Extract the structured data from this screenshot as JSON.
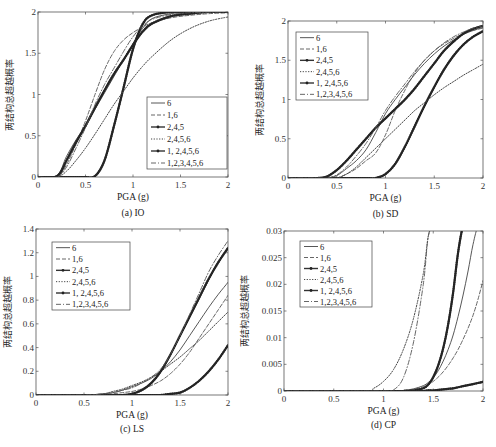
{
  "figure": {
    "ylabel_text": "两结构总超越概率",
    "xlabel_text": "PGA (g)"
  },
  "legend_labels": [
    "6",
    "1,6",
    "2,4,5",
    "2,4,5,6",
    "1, 2,4,5,6",
    "1,2,3,4,5,6"
  ],
  "series_styles": [
    {
      "name": "6",
      "dash": "",
      "width": 0.9,
      "color": "#444444",
      "marker": false
    },
    {
      "name": "1,6",
      "dash": "4,2",
      "width": 0.9,
      "color": "#555555",
      "marker": false
    },
    {
      "name": "2,4,5",
      "dash": "",
      "width": 2.2,
      "color": "#333333",
      "marker": true
    },
    {
      "name": "2,4,5,6",
      "dash": "1.2,1.5",
      "width": 1.0,
      "color": "#444444",
      "marker": false
    },
    {
      "name": "1, 2,4,5,6",
      "dash": "",
      "width": 2.2,
      "color": "#333333",
      "marker": true
    },
    {
      "name": "1,2,3,4,5,6",
      "dash": "5,2,1,2",
      "width": 0.9,
      "color": "#555555",
      "marker": false
    }
  ],
  "chart_data": [
    {
      "type": "line",
      "id": "a",
      "caption": "(a) IO",
      "title": "",
      "xlabel": "PGA (g)",
      "ylabel": "两结构总超越概率",
      "xlim": [
        0,
        2
      ],
      "ylim": [
        0,
        2
      ],
      "xticks": [
        "0",
        "0.5",
        "1",
        "1.5",
        "2"
      ],
      "yticks": [
        "0",
        "0.5",
        "1",
        "1.5",
        "2"
      ],
      "legend_position": "lower right",
      "box": {
        "x0": 38,
        "y0": 12,
        "x1": 228,
        "y1": 177
      },
      "legend_box": {
        "x": 147,
        "y": 97,
        "w": 80,
        "h": 72
      },
      "x": [
        0,
        0.2,
        0.3,
        0.4,
        0.5,
        0.6,
        0.7,
        0.8,
        0.9,
        1.0,
        1.1,
        1.2,
        1.4,
        1.6,
        1.8,
        2.0
      ],
      "series": [
        {
          "name": "6",
          "values": [
            0,
            0.02,
            0.25,
            0.45,
            0.62,
            0.82,
            1.02,
            1.22,
            1.42,
            1.62,
            1.8,
            1.92,
            1.98,
            2.0,
            2.0,
            2.0
          ]
        },
        {
          "name": "1,6",
          "values": [
            0,
            0.0,
            0.15,
            0.4,
            0.68,
            1.0,
            1.3,
            1.52,
            1.66,
            1.75,
            1.82,
            1.87,
            1.93,
            1.96,
            1.98,
            1.99
          ]
        },
        {
          "name": "2,4,5",
          "values": [
            0,
            0,
            0,
            0,
            0,
            0.01,
            0.2,
            0.62,
            1.08,
            1.55,
            1.85,
            1.96,
            2.0,
            2.0,
            2.0,
            2.0
          ]
        },
        {
          "name": "2,4,5,6",
          "values": [
            0,
            0.0,
            0.07,
            0.2,
            0.35,
            0.52,
            0.7,
            0.88,
            1.04,
            1.2,
            1.34,
            1.46,
            1.66,
            1.8,
            1.89,
            1.94
          ]
        },
        {
          "name": "1, 2,4,5,6",
          "values": [
            0,
            0.01,
            0.2,
            0.42,
            0.62,
            0.84,
            1.05,
            1.25,
            1.42,
            1.6,
            1.76,
            1.86,
            1.95,
            1.98,
            2.0,
            2.0
          ]
        },
        {
          "name": "1,2,3,4,5,6",
          "values": [
            0,
            0.0,
            0.12,
            0.35,
            0.6,
            0.88,
            1.12,
            1.32,
            1.52,
            1.7,
            1.83,
            1.91,
            1.97,
            1.99,
            2.0,
            2.0
          ]
        }
      ]
    },
    {
      "type": "line",
      "id": "b",
      "caption": "(b) SD",
      "title": "",
      "xlabel": "PGA (g)",
      "ylabel": "两结构总超越概率",
      "xlim": [
        0,
        2
      ],
      "ylim": [
        0,
        2
      ],
      "xticks": [
        "0",
        "0.5",
        "1",
        "1.5",
        "2"
      ],
      "yticks": [
        "0",
        "0.5",
        "1",
        "1.5",
        "2"
      ],
      "legend_position": "upper left",
      "box": {
        "x0": 288,
        "y0": 21,
        "x1": 483,
        "y1": 178
      },
      "legend_box": {
        "x": 296,
        "y": 32,
        "w": 72,
        "h": 68
      },
      "x": [
        0,
        0.3,
        0.4,
        0.5,
        0.6,
        0.7,
        0.8,
        0.9,
        1.0,
        1.1,
        1.2,
        1.3,
        1.4,
        1.5,
        1.6,
        1.7,
        1.8,
        1.9,
        2.0
      ],
      "series": [
        {
          "name": "6",
          "values": [
            0,
            0,
            0.0,
            0.03,
            0.12,
            0.22,
            0.36,
            0.58,
            0.82,
            1.0,
            1.16,
            1.32,
            1.46,
            1.58,
            1.68,
            1.76,
            1.83,
            1.88,
            1.92
          ]
        },
        {
          "name": "1,6",
          "values": [
            0,
            0,
            0,
            0.0,
            0.05,
            0.12,
            0.22,
            0.32,
            0.55,
            0.86,
            1.12,
            1.34,
            1.5,
            1.62,
            1.71,
            1.78,
            1.84,
            1.88,
            1.91
          ]
        },
        {
          "name": "2,4,5",
          "values": [
            0,
            0,
            0,
            0,
            0,
            0,
            0,
            0.0,
            0.05,
            0.18,
            0.4,
            0.66,
            0.92,
            1.16,
            1.38,
            1.56,
            1.7,
            1.8,
            1.87
          ]
        },
        {
          "name": "2,4,5,6",
          "values": [
            0,
            0,
            0,
            0.0,
            0.05,
            0.14,
            0.26,
            0.38,
            0.5,
            0.62,
            0.74,
            0.86,
            0.96,
            1.06,
            1.15,
            1.23,
            1.31,
            1.38,
            1.45
          ]
        },
        {
          "name": "1, 2,4,5,6",
          "values": [
            0,
            0,
            0.02,
            0.1,
            0.22,
            0.36,
            0.5,
            0.64,
            0.76,
            0.88,
            1.0,
            1.14,
            1.3,
            1.46,
            1.62,
            1.74,
            1.84,
            1.9,
            1.94
          ]
        },
        {
          "name": "1,2,3,4,5,6",
          "values": [
            0,
            0,
            0.0,
            0.04,
            0.14,
            0.28,
            0.44,
            0.64,
            0.86,
            1.04,
            1.2,
            1.36,
            1.5,
            1.62,
            1.72,
            1.8,
            1.86,
            1.91,
            1.94
          ]
        }
      ]
    },
    {
      "type": "line",
      "id": "c",
      "caption": "(c) LS",
      "title": "",
      "xlabel": "PGA (g)",
      "ylabel": "两结构总超越概率",
      "xlim": [
        0,
        2
      ],
      "ylim": [
        0,
        1.4
      ],
      "xticks": [
        "0",
        "0.5",
        "1",
        "1.5",
        "2"
      ],
      "yticks": [
        "0",
        "0.2",
        "0.4",
        "0.6",
        "0.8",
        "1",
        "1.2",
        "1.4"
      ],
      "legend_position": "upper left",
      "box": {
        "x0": 36,
        "y0": 229,
        "x1": 228,
        "y1": 395
      },
      "legend_box": {
        "x": 52,
        "y": 242,
        "w": 78,
        "h": 68
      },
      "x": [
        0,
        0.5,
        0.7,
        0.8,
        0.9,
        1.0,
        1.1,
        1.2,
        1.3,
        1.4,
        1.5,
        1.6,
        1.7,
        1.8,
        1.9,
        2.0
      ],
      "series": [
        {
          "name": "6",
          "values": [
            0,
            0.0,
            0.01,
            0.02,
            0.04,
            0.07,
            0.1,
            0.14,
            0.2,
            0.28,
            0.38,
            0.5,
            0.62,
            0.74,
            0.85,
            0.95
          ]
        },
        {
          "name": "1,6",
          "values": [
            0,
            0.0,
            0.0,
            0.01,
            0.02,
            0.03,
            0.05,
            0.08,
            0.12,
            0.18,
            0.26,
            0.36,
            0.48,
            0.6,
            0.72,
            0.84
          ]
        },
        {
          "name": "2,4,5",
          "values": [
            0,
            0,
            0,
            0,
            0,
            0,
            0,
            0,
            0.0,
            0.01,
            0.02,
            0.06,
            0.12,
            0.2,
            0.3,
            0.42
          ]
        },
        {
          "name": "2,4,5,6",
          "values": [
            0,
            0.0,
            0.01,
            0.03,
            0.05,
            0.08,
            0.11,
            0.15,
            0.2,
            0.26,
            0.32,
            0.39,
            0.46,
            0.54,
            0.62,
            0.7
          ]
        },
        {
          "name": "1, 2,4,5,6",
          "values": [
            0,
            0,
            0,
            0,
            0.0,
            0.01,
            0.04,
            0.1,
            0.2,
            0.34,
            0.5,
            0.66,
            0.82,
            0.98,
            1.12,
            1.24
          ]
        },
        {
          "name": "1,2,3,4,5,6",
          "values": [
            0,
            0.0,
            0.01,
            0.02,
            0.04,
            0.06,
            0.1,
            0.15,
            0.22,
            0.34,
            0.5,
            0.68,
            0.86,
            1.04,
            1.18,
            1.3
          ]
        }
      ]
    },
    {
      "type": "line",
      "id": "d",
      "caption": "(d) CP",
      "title": "",
      "xlabel": "PGA (g)",
      "ylabel": "两结构总超越概率",
      "xlim": [
        0,
        2
      ],
      "ylim": [
        0,
        0.03
      ],
      "xticks": [
        "0",
        "0.5",
        "1",
        "1.5",
        "2"
      ],
      "yticks": [
        "0",
        "0.005",
        "0.01",
        "0.015",
        "0.02",
        "0.025",
        "0.03"
      ],
      "legend_position": "upper left",
      "box": {
        "x0": 284,
        "y0": 231,
        "x1": 483,
        "y1": 391
      },
      "legend_box": {
        "x": 300,
        "y": 241,
        "w": 72,
        "h": 66
      },
      "x": [
        0,
        0.8,
        0.9,
        1.0,
        1.1,
        1.2,
        1.3,
        1.4,
        1.45,
        1.5,
        1.55,
        1.6,
        1.65,
        1.7,
        1.75,
        1.8,
        1.85,
        1.9,
        1.95,
        2.0
      ],
      "series": [
        {
          "name": "6",
          "values": [
            0,
            0,
            0,
            0,
            0.0,
            0.0001,
            0.0004,
            0.001,
            0.0016,
            0.0025,
            0.0038,
            0.0056,
            0.0078,
            0.0105,
            0.014,
            0.018,
            0.0225,
            0.0275,
            0.031,
            0.031
          ]
        },
        {
          "name": "1,6",
          "values": [
            0,
            0,
            0,
            0,
            0.0,
            0.0001,
            0.0003,
            0.0008,
            0.0012,
            0.0018,
            0.0026,
            0.0036,
            0.0048,
            0.0062,
            0.0078,
            0.0097,
            0.0118,
            0.0142,
            0.0172,
            0.0207
          ]
        },
        {
          "name": "2,4,5",
          "values": [
            0,
            0,
            0,
            0,
            0,
            0,
            0.0,
            0.0,
            0.0001,
            0.0001,
            0.0002,
            0.0003,
            0.0004,
            0.0005,
            0.0007,
            0.0009,
            0.0011,
            0.0013,
            0.0015,
            0.0017
          ]
        },
        {
          "name": "2,4,5,6",
          "values": [
            0,
            0.0,
            0.0005,
            0.0018,
            0.004,
            0.0078,
            0.0135,
            0.022,
            0.029,
            0.031,
            0.031,
            0.031,
            0.031,
            0.031,
            0.031,
            0.031,
            0.031,
            0.031,
            0.031,
            0.031
          ]
        },
        {
          "name": "1, 2,4,5,6",
          "values": [
            0,
            0,
            0,
            0,
            0,
            0.0,
            0.0001,
            0.0005,
            0.0012,
            0.0026,
            0.0048,
            0.008,
            0.0125,
            0.0185,
            0.026,
            0.031,
            0.031,
            0.031,
            0.031,
            0.031
          ]
        },
        {
          "name": "1,2,3,4,5,6",
          "values": [
            0,
            0,
            0,
            0.0,
            0.0002,
            0.0025,
            0.009,
            0.02,
            0.029,
            0.031,
            0.031,
            0.031,
            0.031,
            0.031,
            0.031,
            0.031,
            0.031,
            0.031,
            0.031,
            0.031
          ]
        }
      ]
    }
  ]
}
